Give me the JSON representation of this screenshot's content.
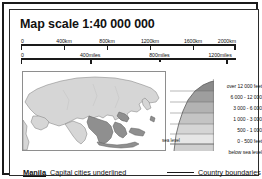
{
  "title": "Map scale 1:40 000 000",
  "scale_bars": [
    {
      "unit": "km",
      "name": "kilometres-scale-bar",
      "labels": [
        "0",
        "400km",
        "800km",
        "1200km",
        "1600km",
        "2000km"
      ],
      "positions_pct": [
        0,
        20,
        40,
        60,
        80,
        100
      ]
    },
    {
      "unit": "miles",
      "name": "miles-scale-bar",
      "labels": [
        "0",
        "400miles",
        "800miles",
        "1200miles"
      ],
      "positions_pct": [
        0,
        32.2,
        64.4,
        96.6
      ]
    }
  ],
  "inset_map": {
    "name": "asia-locator-map",
    "description": "Locator map of Asia with South-East Asia highlighted",
    "land_color": "#d6d6d6",
    "highlight_color": "#8f8f8f",
    "sea_color": "#ffffff",
    "outline_color": "#7a7a7a"
  },
  "elevation_profile": {
    "sea_level_label": "sea level",
    "bands": [
      {
        "label": "over 12 000 feet",
        "color": "#8a8a8a"
      },
      {
        "label": "6 000 - 12 000",
        "color": "#9e9e9e"
      },
      {
        "label": "3 000 - 6 000",
        "color": "#b3b3b3"
      },
      {
        "label": "1 000 - 3 000",
        "color": "#c4c4c4"
      },
      {
        "label": "500 - 1 000",
        "color": "#d5d5d5"
      },
      {
        "label": "0 - 500 feet",
        "color": "#e6e6e6"
      },
      {
        "label": "below sea level",
        "color": "#cfcfcf"
      }
    ]
  },
  "legend": {
    "capital_sample": "Manila",
    "capital_text": "Capital cities underlined",
    "boundaries_text": "Country boundaries"
  },
  "colors": {
    "frame": "#1a1a1a",
    "text": "#111111",
    "rule": "#2b2b2b"
  }
}
